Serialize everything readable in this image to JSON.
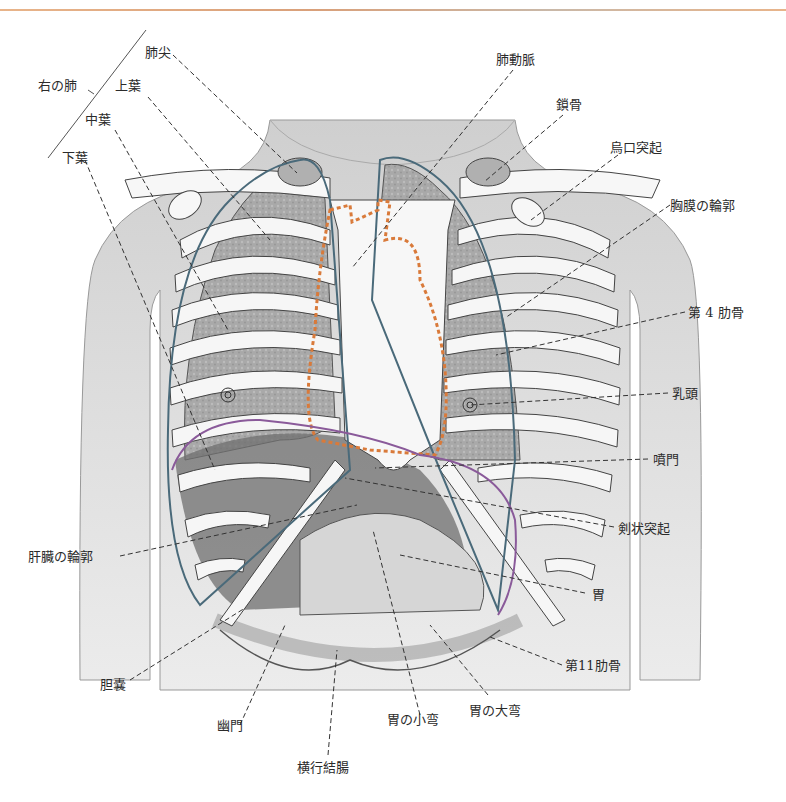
{
  "header": {
    "text": "呼吸器系"
  },
  "figure": {
    "colors": {
      "pleura_outline": "#4a6a7a",
      "heart_outline": "#d97a3a",
      "liver_outline": "#8a5a9a",
      "bone": "#f4f4f4",
      "lung_shade": "#9a9a9a",
      "skin_shade": "#d8d8d8"
    },
    "right_lung_group": "右の肺",
    "labels": {
      "apex": "肺尖",
      "upper_lobe": "上葉",
      "middle_lobe": "中葉",
      "lower_lobe": "下葉",
      "pulmonary_artery": "肺動脈",
      "clavicle": "鎖骨",
      "coracoid": "烏口突起",
      "pleura_outline": "胸膜の輪郭",
      "rib4": "第 4 肋骨",
      "nipple": "乳頭",
      "cardia": "噴門",
      "xiphoid": "剣状突起",
      "liver_outline": "肝臓の輪郭",
      "stomach": "胃",
      "rib11": "第11肋骨",
      "gallbladder": "胆嚢",
      "pylorus": "幽門",
      "lesser_curvature": "胃の小弯",
      "greater_curvature": "胃の大弯",
      "transverse_colon": "横行結腸"
    }
  }
}
